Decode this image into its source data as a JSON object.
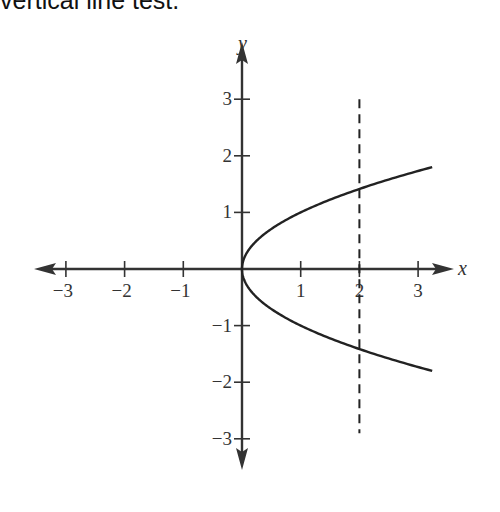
{
  "caption": "vertical line test.",
  "chart_data": {
    "type": "line",
    "title": "",
    "xlabel": "x",
    "ylabel": "y",
    "xlim": [
      -3.4,
      3.4
    ],
    "ylim": [
      -3.4,
      3.4
    ],
    "grid": false,
    "x_ticks": [
      -3,
      -2,
      -1,
      1,
      2,
      3
    ],
    "y_ticks": [
      -3,
      -2,
      -1,
      1,
      2,
      3
    ],
    "x_tick_labels": [
      "−3",
      "−2",
      "−1",
      "1",
      "2",
      "3"
    ],
    "y_tick_labels": [
      "−3",
      "−2",
      "−1",
      "1",
      "2",
      "3"
    ],
    "series": [
      {
        "name": "x = y^2",
        "style": "solid",
        "equation": "x = y^2",
        "y_range": [
          -1.8,
          1.8
        ]
      },
      {
        "name": "vertical line x = 2",
        "style": "dashed",
        "x": 2,
        "y_range": [
          -2.9,
          3.0
        ]
      }
    ]
  }
}
